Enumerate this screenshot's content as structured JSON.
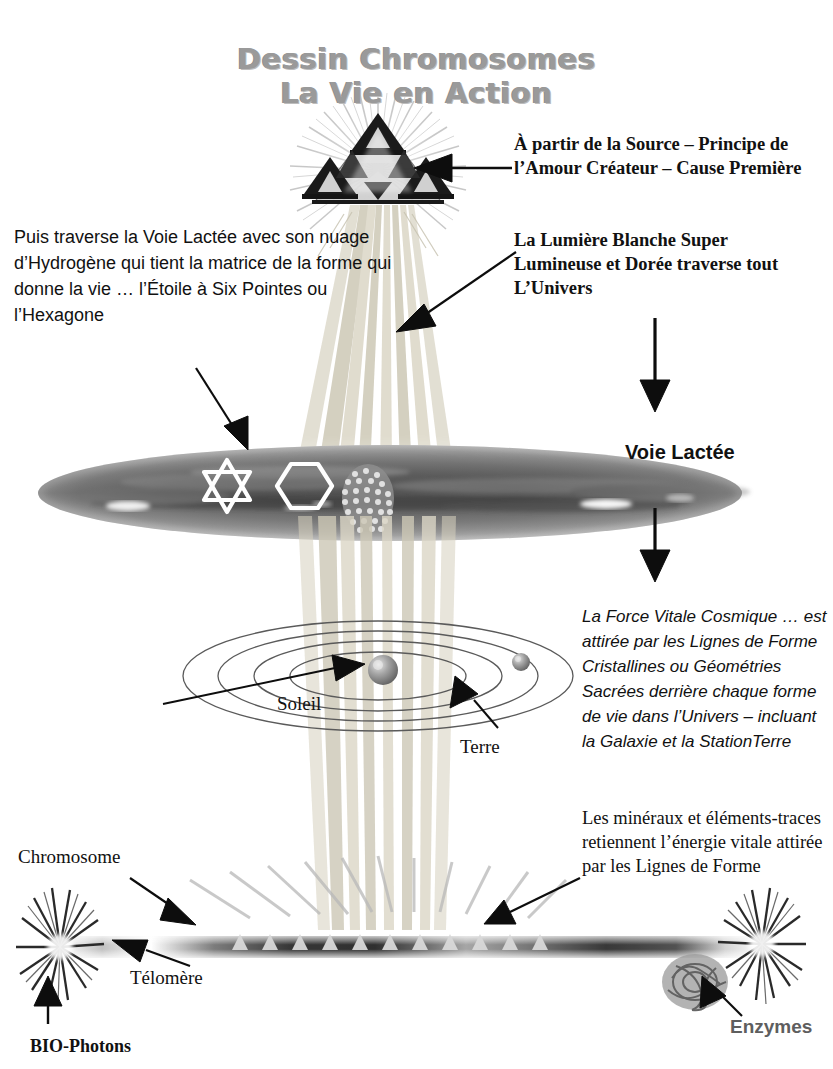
{
  "page": {
    "width": 833,
    "height": 1069,
    "background": "#ffffff",
    "language": "fr"
  },
  "title": {
    "line1": "Dessin Chromosomes",
    "line2": "La Vie en Action",
    "color": "#9a9a9a"
  },
  "annotations": {
    "source": {
      "text": "À partir de la Source – Principe de l’Amour Créateur – Cause Première",
      "style": "serif-bold",
      "color": "#111111"
    },
    "lumiere": {
      "text": "La Lumière Blanche Super Lumineuse et Dorée traverse tout L’Univers",
      "style": "serif-bold",
      "color": "#111111"
    },
    "voie_lactee_desc": {
      "text": "Puis traverse la Voie Lactée avec son nuage d’Hydrogène qui tient la matrice de la forme qui donne la vie … l’Étoile à Six Pointes ou l’Hexagone",
      "style": "sans-regular",
      "color": "#111111"
    },
    "force_vitale": {
      "text": "La Force Vitale Cosmique … est attirée par les Lignes de Forme Cristallines ou Géométries Sacrées derrière chaque forme de vie dans l’Univers – incluant la Galaxie et la StationTerre",
      "style": "sans-italic",
      "color": "#111111"
    },
    "mineraux": {
      "text": "Les minéraux et éléments-traces retiennent l’énergie vitale attirée par les Lignes de Forme",
      "style": "serif-regular",
      "color": "#111111"
    }
  },
  "labels": {
    "voie_lactee": {
      "text": "Voie Lactée",
      "style": "sans-bold",
      "color": "#111111"
    },
    "soleil": {
      "text": "Soleil",
      "style": "serif-regular",
      "color": "#111111"
    },
    "terre": {
      "text": "Terre",
      "style": "serif-regular",
      "color": "#111111"
    },
    "chromosome": {
      "text": "Chromosome",
      "style": "serif-regular",
      "color": "#111111"
    },
    "telomere": {
      "text": "Télomère",
      "style": "serif-regular",
      "color": "#111111"
    },
    "biophotons": {
      "text": "BIO-Photons",
      "style": "serif-bold",
      "color": "#111111"
    },
    "enzymes": {
      "text": "Enzymes",
      "style": "sans-bold",
      "color": "#5e5e5e"
    }
  },
  "figure_elements": {
    "source_symbol": "sierpinski-triangle-with-radiating-light",
    "light_beam": "vertical-golden-white-beam",
    "galaxy": "milky-way-ellipse-grayscale",
    "star_of_david": "six-pointed-star-outline-white",
    "hexagon": "hexagon-outline-white",
    "hydrogen_cloud": "granular-cluster",
    "solar_system": "four-concentric-orbital-ellipses",
    "sun": "gray-sphere",
    "earth": "small-gray-sphere",
    "chromosome": "dark-gradient-rod-with-telomere-ends",
    "biophoton_burst": "starburst-left-end",
    "enzyme_burst": "starburst-right-end",
    "enzyme_cluster": "tangled-gray-blob",
    "form_lines": "crystalline-ray-lines"
  },
  "colors": {
    "ink": "#111111",
    "title_gray": "#9a9a9a",
    "enzyme_gray": "#5e5e5e",
    "beam": "#d8d4c8",
    "galaxy_dark": "#4a4a4a",
    "galaxy_light": "#cfcfcf"
  }
}
